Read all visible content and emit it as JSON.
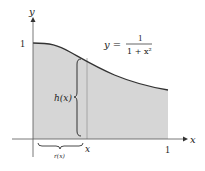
{
  "diagram": {
    "axis_labels": {
      "x": "x",
      "y": "y"
    },
    "tick_labels": {
      "y_one": "1",
      "x_one": "1",
      "x_var": "x"
    },
    "equation": {
      "lhs": "y =",
      "numerator": "1",
      "denominator": "1 + x²"
    },
    "annotations": {
      "height": "h(x)",
      "radius": "r(x)"
    },
    "colors": {
      "shade": "#d6d6d6",
      "curve": "#333333",
      "axes": "#555555"
    }
  }
}
